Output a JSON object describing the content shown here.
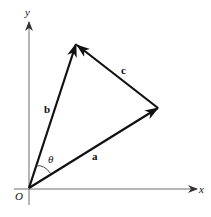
{
  "diagram": {
    "type": "vector-triangle",
    "axes": {
      "x_label": "x",
      "y_label": "y",
      "origin_label": "O",
      "color": "#6e6e6e"
    },
    "vectors": [
      {
        "name": "a",
        "label": "a",
        "from": "O",
        "to": "tip-a"
      },
      {
        "name": "b",
        "label": "b",
        "from": "O",
        "to": "tip-b"
      },
      {
        "name": "c",
        "label": "c",
        "from": "tip-a",
        "to": "tip-b"
      }
    ],
    "angle_label": "θ",
    "vector_color": "#111111"
  }
}
